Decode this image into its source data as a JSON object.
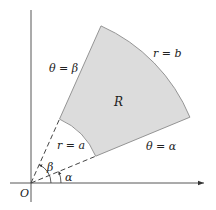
{
  "diagram": {
    "origin_label": "O",
    "region_label": "R",
    "labels": {
      "outer_arc": "r = b",
      "inner_arc": "r = a",
      "ray_beta": "θ = β",
      "ray_alpha": "θ = α",
      "angle_beta": "β",
      "angle_alpha": "α"
    },
    "geometry": {
      "origin": [
        31,
        183
      ],
      "alpha_deg": 22.5,
      "beta_deg": 66,
      "r_inner": 70,
      "r_outer": 172
    },
    "colors": {
      "region_fill": "#dcdcdc",
      "stroke": "#555555",
      "axis": "#444444"
    }
  }
}
